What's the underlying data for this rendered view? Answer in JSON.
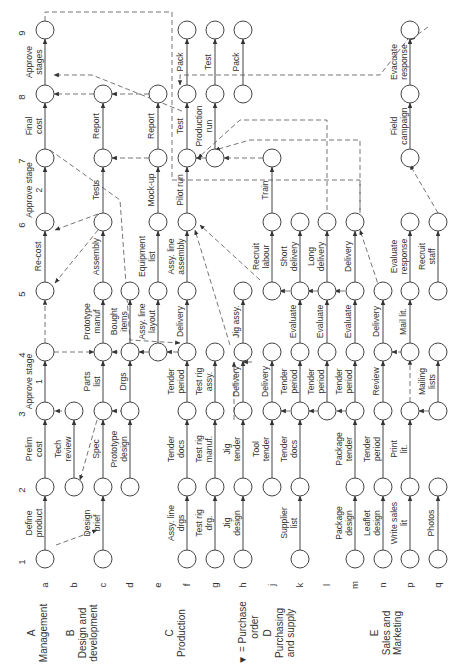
{
  "diagram": {
    "orientation": "rotated-90-ccw",
    "stages": [
      "1",
      "2",
      "3",
      "4",
      "5",
      "6",
      "7",
      "8",
      "9"
    ],
    "rows": [
      "a",
      "b",
      "c",
      "d",
      "e",
      "f",
      "g",
      "h",
      "j",
      "k",
      "l",
      "m",
      "n",
      "p",
      "q"
    ],
    "groups": [
      {
        "letter": "A",
        "name": "Management",
        "rows": [
          "a",
          "b"
        ]
      },
      {
        "letter": "B",
        "name": "Design and development",
        "rows": [
          "c",
          "d"
        ]
      },
      {
        "letter": "C",
        "name": "Production",
        "rows": [
          "e",
          "f",
          "g"
        ]
      },
      {
        "letter": "D",
        "name": "Purchasing and supply",
        "rows": [
          "h",
          "j",
          "k",
          "l",
          "m"
        ]
      },
      {
        "letter": "E",
        "name": "Sales and Marketing",
        "rows": [
          "n",
          "p",
          "q"
        ]
      }
    ],
    "legend": {
      "symbol": "▼",
      "text": "= Purchase order"
    },
    "activities": [
      {
        "row": "a",
        "from": 1,
        "to": 2,
        "label": "Define product"
      },
      {
        "row": "a",
        "from": 2,
        "to": 3,
        "label": "Prelim cost"
      },
      {
        "row": "a",
        "from": 3,
        "to": 4,
        "label": "Approve stage 1"
      },
      {
        "row": "a",
        "from": 5,
        "to": 6,
        "label": "Re-cost"
      },
      {
        "row": "a",
        "from": 6,
        "to": 7,
        "label": "Approve stage 2"
      },
      {
        "row": "a",
        "from": 7,
        "to": 8,
        "label": "Final cost"
      },
      {
        "row": "a",
        "from": 8,
        "to": 9,
        "label": "Approve stages"
      },
      {
        "row": "b",
        "from": 2,
        "to": 3,
        "label": "Tech review"
      },
      {
        "row": "c",
        "from": 1,
        "to": 2,
        "label": "Design brief"
      },
      {
        "row": "c",
        "from": 2,
        "to": 3,
        "label": "Spec"
      },
      {
        "row": "c",
        "from": 3,
        "to": 4,
        "label": "Parts list"
      },
      {
        "row": "c",
        "from": 4,
        "to": 5,
        "label": "Prototype manuf"
      },
      {
        "row": "c",
        "from": 5,
        "to": 6,
        "label": "Assembly"
      },
      {
        "row": "c",
        "from": 6,
        "to": 7,
        "label": "Tests"
      },
      {
        "row": "c",
        "from": 7,
        "to": 8,
        "label": "Report"
      },
      {
        "row": "d",
        "from": 2,
        "to": 3,
        "label": "Prototype design"
      },
      {
        "row": "d",
        "from": 3,
        "to": 4,
        "label": "Drgs"
      },
      {
        "row": "d",
        "from": 4,
        "to": 5,
        "label": "Bought items"
      },
      {
        "row": "e",
        "from": 4,
        "to": 5,
        "label": "Assy. line layout"
      },
      {
        "row": "e",
        "from": 5,
        "to": 6,
        "label": "Equipment list"
      },
      {
        "row": "e",
        "from": 6,
        "to": 7,
        "label": "Mock-up"
      },
      {
        "row": "e",
        "from": 7,
        "to": 8,
        "label": "Report"
      },
      {
        "row": "f",
        "from": 1,
        "to": 2,
        "label": "Assy. line drgs"
      },
      {
        "row": "f",
        "from": 2,
        "to": 3,
        "label": "Tender docs"
      },
      {
        "row": "f",
        "from": 3,
        "to": 4,
        "label": "Tender period"
      },
      {
        "row": "f",
        "from": 4,
        "to": 5,
        "label": "Delivery"
      },
      {
        "row": "f",
        "from": 5,
        "to": 6,
        "label": "Assy. line assembly"
      },
      {
        "row": "f",
        "from": 6,
        "to": 7,
        "label": "Pilot run"
      },
      {
        "row": "f",
        "from": 7,
        "to": 8,
        "label": "Test"
      },
      {
        "row": "f",
        "from": 8,
        "to": 9,
        "label": "Pack"
      },
      {
        "row": "g",
        "from": 1,
        "to": 2,
        "label": "Test rig drg."
      },
      {
        "row": "g",
        "from": 2,
        "to": 3,
        "label": "Test rig manuf."
      },
      {
        "row": "g",
        "from": 3,
        "to": 4,
        "label": "Test rig assy."
      },
      {
        "row": "g",
        "from": 7,
        "to": 8,
        "label": "Production run"
      },
      {
        "row": "g",
        "from": 8,
        "to": 9,
        "label": "Test"
      },
      {
        "row": "h",
        "from": 1,
        "to": 2,
        "label": "Jig design"
      },
      {
        "row": "h",
        "from": 2,
        "to": 3,
        "label": "Jig tender"
      },
      {
        "row": "h",
        "from": 3,
        "to": 4,
        "label": "Delivery"
      },
      {
        "row": "h",
        "from": 4,
        "to": 5,
        "label": "Jig assy."
      },
      {
        "row": "h",
        "from": 8,
        "to": 9,
        "label": "Pack"
      },
      {
        "row": "j",
        "from": 2,
        "to": 3,
        "label": "Tool tender"
      },
      {
        "row": "j",
        "from": 3,
        "to": 4,
        "label": "Delivery"
      },
      {
        "row": "j",
        "from": 5,
        "to": 6,
        "label": "Recruit labour"
      },
      {
        "row": "j",
        "from": 6,
        "to": 7,
        "label": "Train"
      },
      {
        "row": "k",
        "from": 1,
        "to": 2,
        "label": "Supplier list"
      },
      {
        "row": "k",
        "from": 2,
        "to": 3,
        "label": "Tender docs"
      },
      {
        "row": "k",
        "from": 3,
        "to": 4,
        "label": "Tender period"
      },
      {
        "row": "k",
        "from": 4,
        "to": 5,
        "label": "Evaluate"
      },
      {
        "row": "k",
        "from": 5,
        "to": 6,
        "label": "Short delivery"
      },
      {
        "row": "l",
        "from": 3,
        "to": 4,
        "label": "Tender period"
      },
      {
        "row": "l",
        "from": 4,
        "to": 5,
        "label": "Evaluate"
      },
      {
        "row": "l",
        "from": 5,
        "to": 6,
        "label": "Long delivery"
      },
      {
        "row": "m",
        "from": 1,
        "to": 2,
        "label": "Package design"
      },
      {
        "row": "m",
        "from": 2,
        "to": 3,
        "label": "Package tender"
      },
      {
        "row": "m",
        "from": 3,
        "to": 4,
        "label": "Tender period"
      },
      {
        "row": "m",
        "from": 4,
        "to": 5,
        "label": "Evaluate"
      },
      {
        "row": "m",
        "from": 5,
        "to": 6,
        "label": "Delivery"
      },
      {
        "row": "n",
        "from": 1,
        "to": 2,
        "label": "Leaflet design"
      },
      {
        "row": "n",
        "from": 2,
        "to": 3,
        "label": "Tender period"
      },
      {
        "row": "n",
        "from": 3,
        "to": 4,
        "label": "Review"
      },
      {
        "row": "n",
        "from": 4,
        "to": 5,
        "label": "Delivery"
      },
      {
        "row": "p",
        "from": 1,
        "to": 2,
        "label": "Write sales lit"
      },
      {
        "row": "p",
        "from": 2,
        "to": 3,
        "label": "Print lit."
      },
      {
        "row": "p",
        "from": 4,
        "to": 5,
        "label": "Mail lit."
      },
      {
        "row": "p",
        "from": 5,
        "to": 6,
        "label": "Evaluate response"
      },
      {
        "row": "p",
        "from": 7,
        "to": 8,
        "label": "Field campaign"
      },
      {
        "row": "p",
        "from": 8,
        "to": 9,
        "label": "Evacuate response"
      },
      {
        "row": "q",
        "from": 1,
        "to": 2,
        "label": "Photos"
      },
      {
        "row": "q",
        "from": 3,
        "to": 4,
        "label": "Mailing lists"
      },
      {
        "row": "q",
        "from": 5,
        "to": 6,
        "label": "Recruit staff"
      }
    ]
  }
}
